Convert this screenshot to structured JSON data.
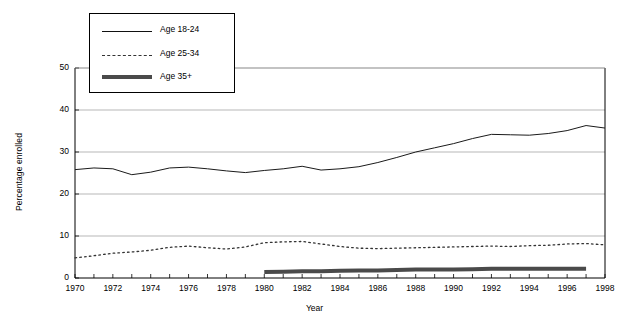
{
  "chart_data": {
    "type": "line",
    "title": "",
    "xlabel": "Year",
    "ylabel": "Percentage enrolled",
    "xlim": [
      1970,
      1998
    ],
    "ylim": [
      0,
      50
    ],
    "yticks": [
      0,
      10,
      20,
      30,
      40,
      50
    ],
    "xticks": [
      1970,
      1972,
      1974,
      1976,
      1978,
      1980,
      1982,
      1984,
      1986,
      1988,
      1990,
      1992,
      1994,
      1996,
      1998
    ],
    "grid": "horizontal",
    "legend_position": "top-left-inside",
    "x": [
      1970,
      1971,
      1972,
      1973,
      1974,
      1975,
      1976,
      1977,
      1978,
      1979,
      1980,
      1981,
      1982,
      1983,
      1984,
      1985,
      1986,
      1987,
      1988,
      1989,
      1990,
      1991,
      1992,
      1993,
      1994,
      1995,
      1996,
      1997,
      1998
    ],
    "series": [
      {
        "name": "Age 18-24",
        "style": "solid",
        "color": "#1a1a1a",
        "values": [
          25.8,
          26.2,
          26.0,
          24.6,
          25.2,
          26.2,
          26.4,
          26.0,
          25.5,
          25.1,
          25.6,
          26.0,
          26.6,
          25.7,
          26.0,
          26.5,
          27.5,
          28.7,
          30.0,
          31.0,
          32.0,
          33.2,
          34.2,
          34.1,
          34.0,
          34.4,
          35.1,
          36.3,
          35.7
        ]
      },
      {
        "name": "Age 25-34",
        "style": "dotted",
        "color": "#333333",
        "values": [
          4.8,
          5.3,
          5.9,
          6.2,
          6.6,
          7.3,
          7.6,
          7.2,
          6.9,
          7.4,
          8.4,
          8.6,
          8.7,
          8.1,
          7.5,
          7.1,
          7.0,
          7.1,
          7.2,
          7.3,
          7.4,
          7.5,
          7.6,
          7.5,
          7.7,
          7.8,
          8.1,
          8.2,
          7.9
        ]
      },
      {
        "name": "Age 35+",
        "style": "thick",
        "color": "#4a4a4a",
        "values": [
          null,
          null,
          null,
          null,
          null,
          null,
          null,
          null,
          null,
          null,
          1.4,
          1.5,
          1.6,
          1.6,
          1.7,
          1.8,
          1.8,
          1.9,
          2.0,
          2.0,
          2.0,
          2.1,
          2.2,
          2.2,
          2.2,
          2.2,
          2.2,
          2.2,
          null
        ]
      }
    ]
  },
  "axis": {
    "ytick_labels": [
      "50",
      "40",
      "30",
      "20",
      "10",
      "0"
    ],
    "xtick_labels": [
      "1970",
      "1972",
      "1974",
      "1976",
      "1978",
      "1980",
      "1982",
      "1984",
      "1986",
      "1988",
      "1990",
      "1992",
      "1994",
      "1996",
      "1998"
    ],
    "ylabel_text": "Percentage enrolled",
    "xlabel_text": "Year"
  },
  "legend": {
    "entries": [
      {
        "label": "Age 18-24"
      },
      {
        "label": "Age 25-34"
      },
      {
        "label": "Age 35+"
      }
    ]
  }
}
